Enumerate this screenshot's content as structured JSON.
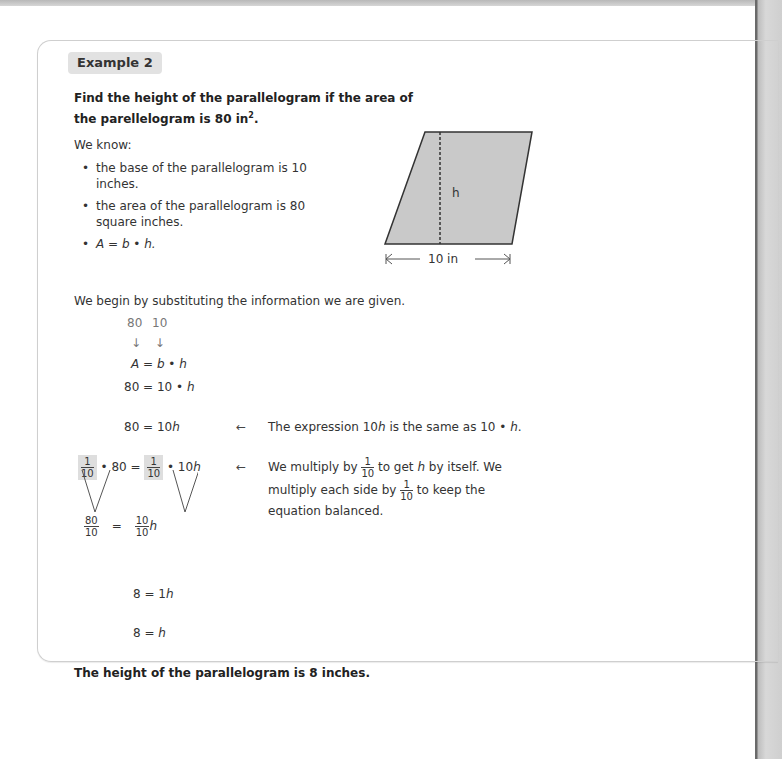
{
  "example": {
    "badge": "Example 2",
    "prompt": "Find the height of the parallelogram if the area of the parellelogram is 80 in",
    "prompt_sup": "2",
    "prompt_end": ".",
    "we_know_label": "We know:",
    "bullets": [
      "the base of the parallelogram is 10 inches.",
      "the area of the parallelogram is 80 square inches.",
      "A = b • h."
    ],
    "figure": {
      "height_label": "h",
      "base_label": "10 in",
      "fill": "#c9c9c9"
    },
    "intro": "We begin by substituting the information we are given.",
    "substitution": {
      "values": "80 10",
      "arrows": "↓ ↓"
    },
    "steps": {
      "formula": {
        "lhs": "A",
        "eq": " = ",
        "b": "b",
        "dot": " • ",
        "h": "h"
      },
      "sub": {
        "lhs": "80 = 10 • ",
        "h": "h"
      },
      "simplified": {
        "lhs": "80 = 10",
        "h": "h"
      },
      "multiply": {
        "frac_num": "1",
        "frac_den": "10",
        "mid1": " • 80 = ",
        "mid2": " • 10",
        "h": "h"
      },
      "divided": {
        "left_num": "80",
        "left_den": "10",
        "eq": "=",
        "right_num": "10",
        "right_den": "10",
        "h": "h"
      },
      "one_h": {
        "lhs": "8 = 1",
        "h": "h"
      },
      "final": {
        "lhs": "8 = ",
        "h": "h"
      }
    },
    "notes": {
      "arrow": "←",
      "note1_a": "The expression 10",
      "note1_h": "h",
      "note1_b": " is the same as 10 • ",
      "note1_h2": "h",
      "note1_c": ".",
      "note2_a": "We multiply by ",
      "note2_b": " to get ",
      "note2_h": "h",
      "note2_c": " by itself. We",
      "note2_line2_a": "multiply each side by ",
      "note2_line2_b": " to keep the",
      "note2_line3": "equation balanced.",
      "frac_num": "1",
      "frac_den": "10"
    },
    "conclusion": "The height of the parallelogram is 8 inches."
  }
}
